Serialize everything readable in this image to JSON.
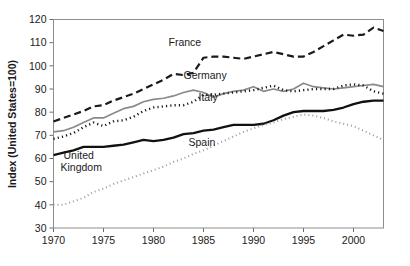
{
  "chart_data": {
    "type": "line",
    "title": "",
    "xlabel": "",
    "ylabel": "Index  (United States=100)",
    "xlim": [
      1970,
      2003
    ],
    "ylim": [
      30,
      120
    ],
    "ytick_labels": [
      "30",
      "40",
      "50",
      "60",
      "70",
      "80",
      "90",
      "100",
      "110",
      "120"
    ],
    "ytick_values": [
      30,
      40,
      50,
      60,
      70,
      80,
      90,
      100,
      110,
      120
    ],
    "xtick_labels": [
      "1970",
      "1975",
      "1980",
      "1985",
      "1990",
      "1995",
      "2000"
    ],
    "xtick_values": [
      1970,
      1975,
      1980,
      1985,
      1990,
      1995,
      2000
    ],
    "grid": false,
    "legend_position": "inline-labels",
    "x": [
      1970,
      1971,
      1972,
      1973,
      1974,
      1975,
      1976,
      1977,
      1978,
      1979,
      1980,
      1981,
      1982,
      1983,
      1984,
      1985,
      1986,
      1987,
      1988,
      1989,
      1990,
      1991,
      1992,
      1993,
      1994,
      1995,
      1996,
      1997,
      1998,
      1999,
      2000,
      2001,
      2002,
      2003
    ],
    "series": [
      {
        "name": "France",
        "style": "dashed",
        "color": "#1a1a1a",
        "width": 2.2,
        "dash": "7,4",
        "label_x": 1981.5,
        "label_y": 108.5,
        "values": [
          76.0,
          77.5,
          79.0,
          80.5,
          82.5,
          83.0,
          85.0,
          86.5,
          88.0,
          90.0,
          92.0,
          94.0,
          96.5,
          96.0,
          97.0,
          103.5,
          104.0,
          104.0,
          103.5,
          103.0,
          104.0,
          105.0,
          106.0,
          105.0,
          104.0,
          104.0,
          106.0,
          108.5,
          111.0,
          113.5,
          113.0,
          113.5,
          116.5,
          115.0
        ]
      },
      {
        "name": "Germany",
        "style": "solid-gray",
        "color": "#8a8a8a",
        "width": 1.7,
        "dash": "none",
        "label_x": 1983.0,
        "label_y": 94.5,
        "values": [
          71.5,
          72.0,
          73.5,
          75.5,
          77.5,
          77.5,
          79.5,
          81.5,
          82.5,
          84.5,
          85.5,
          86.0,
          87.0,
          88.5,
          89.5,
          88.5,
          86.5,
          88.0,
          89.0,
          89.5,
          91.0,
          89.0,
          90.0,
          89.0,
          90.0,
          92.5,
          91.0,
          90.5,
          90.0,
          90.5,
          91.0,
          91.5,
          92.0,
          91.0
        ]
      },
      {
        "name": "Italy",
        "style": "dotted-heavy",
        "color": "#1a1a1a",
        "width": 2.4,
        "dash": "1.2,3.1",
        "label_x": 1984.5,
        "label_y": 85.0,
        "values": [
          68.5,
          69.5,
          71.0,
          73.5,
          75.5,
          74.0,
          76.0,
          76.5,
          78.0,
          80.5,
          82.0,
          82.5,
          83.0,
          83.0,
          84.5,
          87.5,
          87.5,
          88.0,
          88.5,
          89.0,
          89.5,
          90.5,
          91.5,
          89.5,
          89.0,
          89.5,
          90.0,
          90.0,
          90.0,
          91.5,
          92.0,
          91.5,
          89.0,
          88.0
        ]
      },
      {
        "name": "United Kingdom",
        "style": "solid-black",
        "color": "#111111",
        "width": 2.3,
        "label_line1": "United",
        "label_line2": "Kingdom",
        "label_x": 1971.0,
        "label_y": 60.0,
        "values": [
          61.5,
          62.5,
          63.5,
          65.0,
          65.0,
          65.0,
          65.5,
          66.0,
          67.0,
          68.0,
          67.5,
          68.0,
          69.0,
          70.5,
          71.0,
          72.0,
          72.5,
          73.5,
          74.5,
          74.5,
          74.5,
          75.0,
          76.5,
          78.5,
          80.0,
          80.5,
          80.5,
          80.5,
          81.0,
          82.0,
          83.5,
          84.5,
          85.0,
          85.0
        ]
      },
      {
        "name": "Spain",
        "style": "dotted-fine",
        "color": "#9a9a9a",
        "width": 2.0,
        "dash": "1,3",
        "label_x": 1983.5,
        "label_y": 65.5,
        "values": [
          40.0,
          40.0,
          41.5,
          43.0,
          45.5,
          47.0,
          49.0,
          50.5,
          52.0,
          53.5,
          55.0,
          56.5,
          58.5,
          60.0,
          62.0,
          63.5,
          65.5,
          67.5,
          69.5,
          71.5,
          73.0,
          74.5,
          75.5,
          77.0,
          78.0,
          79.0,
          78.5,
          77.5,
          76.0,
          75.0,
          74.0,
          72.0,
          70.0,
          68.0
        ]
      }
    ]
  }
}
